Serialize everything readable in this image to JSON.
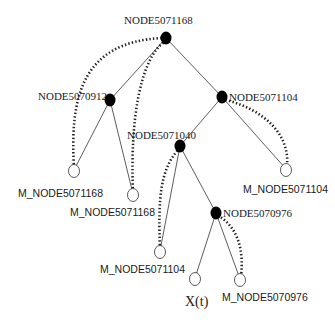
{
  "diagram": {
    "type": "tree",
    "nodes": {
      "root": {
        "label": "NODE5071168",
        "kind": "internal"
      },
      "n912": {
        "label": "NODE5070912",
        "kind": "internal"
      },
      "n1104": {
        "label": "NODE5071104",
        "kind": "internal"
      },
      "n1040": {
        "label": "NODE5071040",
        "kind": "internal"
      },
      "n976": {
        "label": "NODE5070976",
        "kind": "internal"
      },
      "leaf1": {
        "label": "M_NODE5071168",
        "kind": "leaf"
      },
      "leaf2": {
        "label": "M_NODE5071168",
        "kind": "leaf"
      },
      "leaf3": {
        "label": "M_NODE5071104",
        "kind": "leaf"
      },
      "leaf4": {
        "label": "M_NODE5071104",
        "kind": "leaf"
      },
      "leaf5": {
        "label": "X(t)",
        "kind": "leaf"
      },
      "leaf6": {
        "label": "M_NODE5070976",
        "kind": "leaf"
      }
    },
    "edges": [
      [
        "root",
        "n912"
      ],
      [
        "root",
        "n1104"
      ],
      [
        "n912",
        "leaf1"
      ],
      [
        "n912",
        "leaf2"
      ],
      [
        "n1104",
        "n1040"
      ],
      [
        "n1104",
        "leaf3"
      ],
      [
        "n1040",
        "leaf4"
      ],
      [
        "n1040",
        "n976"
      ],
      [
        "n976",
        "leaf5"
      ],
      [
        "n976",
        "leaf6"
      ]
    ],
    "back_references": [
      [
        "leaf1",
        "root"
      ],
      [
        "leaf2",
        "root"
      ],
      [
        "leaf3",
        "n1104"
      ],
      [
        "leaf4",
        "n1040"
      ],
      [
        "leaf6",
        "n976"
      ]
    ]
  }
}
